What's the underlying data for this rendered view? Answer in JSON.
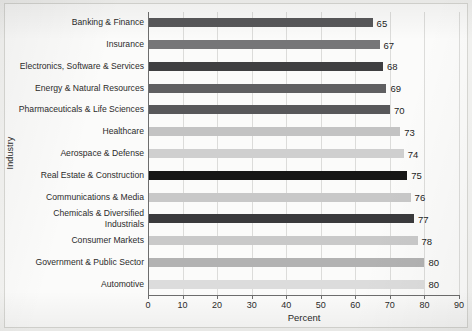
{
  "chart_data": {
    "type": "bar",
    "orientation": "horizontal",
    "title": "",
    "xlabel": "Percent",
    "ylabel": "Industry",
    "xlim": [
      0,
      90
    ],
    "xticks": [
      0,
      10,
      20,
      30,
      40,
      50,
      60,
      70,
      80,
      90
    ],
    "grid": "vertical",
    "legend": "none",
    "categories": [
      "Banking & Finance",
      "Insurance",
      "Electronics, Software & Services",
      "Energy & Natural Resources",
      "Pharmaceuticals & Life Sciences",
      "Healthcare",
      "Aerospace & Defense",
      "Real Estate & Construction",
      "Communications & Media",
      "Chemicals & Diversified\nIndustrials",
      "Consumer Markets",
      "Government & Public Sector",
      "Automotive"
    ],
    "values": [
      65,
      67,
      68,
      69,
      70,
      73,
      74,
      75,
      76,
      77,
      78,
      80,
      80
    ],
    "value_labels": [
      "65",
      "67",
      "68",
      "69",
      "70",
      "73",
      "74",
      "75",
      "76",
      "77",
      "78",
      "80",
      "80"
    ],
    "bar_colors": [
      "#58585a",
      "#767678",
      "#3f3f41",
      "#5f5f61",
      "#58585a",
      "#c3c3c3",
      "#cfcfcf",
      "#161616",
      "#c8c8c8",
      "#3a3a3c",
      "#c9c9c9",
      "#b2b2b2",
      "#dcdcdc"
    ]
  },
  "axes": {
    "xlabel": "Percent",
    "ylabel": "Industry"
  }
}
